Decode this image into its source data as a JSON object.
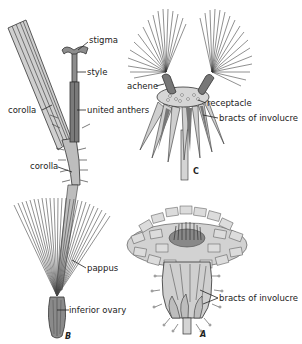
{
  "figure": {
    "colors": {
      "line": "#333333",
      "fill_light": "#c9c9c9",
      "fill_mid": "#9a9a9a",
      "fill_dark": "#6d6d6d",
      "background": "#ffffff"
    },
    "panels": [
      {
        "id": "floret",
        "labels": [
          "stigma",
          "style",
          "corolla",
          "united anthers",
          "corolla"
        ]
      },
      {
        "id": "B",
        "letter": "B",
        "labels": [
          "pappus",
          "inferior ovary"
        ]
      },
      {
        "id": "C",
        "letter": "C",
        "labels": [
          "achene",
          "receptacle",
          "bracts of involucre"
        ]
      },
      {
        "id": "A",
        "letter": "A",
        "labels": [
          "bracts of involucre"
        ]
      }
    ]
  },
  "labels": {
    "stigma": "stigma",
    "style": "style",
    "corolla_upper": "corolla",
    "united_anthers": "united anthers",
    "corolla_lower": "corolla",
    "pappus": "pappus",
    "inferior_ovary": "inferior ovary",
    "achene": "achene",
    "receptacle": "receptacle",
    "bracts_c": "bracts of involucre",
    "bracts_a": "bracts of involucre",
    "letter_a": "A",
    "letter_b": "B",
    "letter_c": "C"
  }
}
